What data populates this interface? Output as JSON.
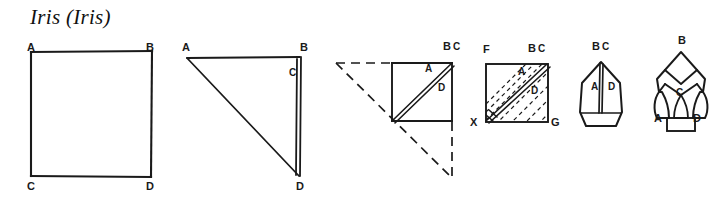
{
  "page": {
    "title": "Iris (Iris)",
    "background_color": "#ffffff",
    "ink_color": "#1a1a1a",
    "width": 725,
    "height": 205
  },
  "steps": [
    {
      "id": "step-1",
      "shape": "square",
      "labels": [
        {
          "text": "A",
          "x": 27,
          "y": 42
        },
        {
          "text": "B",
          "x": 146,
          "y": 42
        },
        {
          "text": "C",
          "x": 27,
          "y": 181
        },
        {
          "text": "D",
          "x": 146,
          "y": 181
        }
      ]
    },
    {
      "id": "step-2",
      "shape": "diagonal-fold-triangle",
      "labels": [
        {
          "text": "A",
          "x": 182,
          "y": 42
        },
        {
          "text": "B",
          "x": 300,
          "y": 42
        },
        {
          "text": "C",
          "x": 289,
          "y": 68
        },
        {
          "text": "D",
          "x": 296,
          "y": 181
        }
      ]
    },
    {
      "id": "step-3",
      "shape": "folded-square-with-dashed-outline",
      "labels": [
        {
          "text": "B",
          "x": 443,
          "y": 41
        },
        {
          "text": "C",
          "x": 453,
          "y": 42
        },
        {
          "text": "A",
          "x": 425,
          "y": 64
        },
        {
          "text": "D",
          "x": 438,
          "y": 83
        }
      ]
    },
    {
      "id": "step-4",
      "shape": "hatched-square",
      "labels": [
        {
          "text": "F",
          "x": 483,
          "y": 44
        },
        {
          "text": "B",
          "x": 528,
          "y": 43
        },
        {
          "text": "C",
          "x": 538,
          "y": 44
        },
        {
          "text": "A",
          "x": 518,
          "y": 67
        },
        {
          "text": "D",
          "x": 531,
          "y": 86
        },
        {
          "text": "X",
          "x": 470,
          "y": 117
        },
        {
          "text": "G",
          "x": 551,
          "y": 117
        }
      ]
    },
    {
      "id": "step-5",
      "shape": "petal-pentagon",
      "labels": [
        {
          "text": "B",
          "x": 592,
          "y": 41
        },
        {
          "text": "C",
          "x": 602,
          "y": 42
        },
        {
          "text": "A",
          "x": 591,
          "y": 82
        },
        {
          "text": "D",
          "x": 608,
          "y": 82
        }
      ]
    },
    {
      "id": "step-6",
      "shape": "finished-iris-flower",
      "labels": [
        {
          "text": "B",
          "x": 678,
          "y": 35
        },
        {
          "text": "C",
          "x": 676,
          "y": 88
        },
        {
          "text": "A",
          "x": 654,
          "y": 113
        },
        {
          "text": "D",
          "x": 693,
          "y": 113
        }
      ]
    }
  ]
}
